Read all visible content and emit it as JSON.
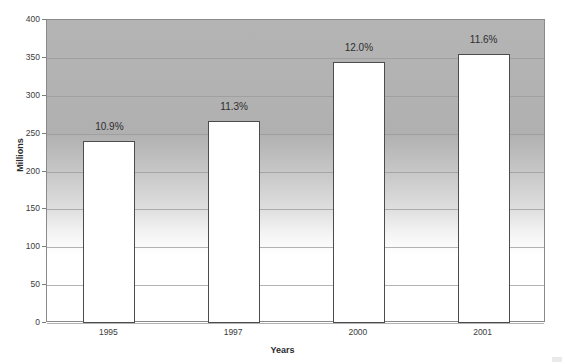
{
  "chart_data": {
    "type": "bar",
    "title": "",
    "xlabel": "Years",
    "ylabel": "Millions",
    "categories": [
      "1995",
      "1997",
      "2000",
      "2001"
    ],
    "values": [
      240,
      267,
      344,
      355
    ],
    "data_labels": [
      "10.9%",
      "11.3%",
      "12.0%",
      "11.6%"
    ],
    "ylim": [
      0,
      400
    ],
    "ytick_labels": [
      "400",
      "350",
      "300",
      "250",
      "200",
      "150",
      "100",
      "50",
      "0"
    ],
    "ytick_values": [
      400,
      350,
      300,
      250,
      200,
      150,
      100,
      50,
      0
    ],
    "grid": true,
    "legend": false,
    "legend_position": "none",
    "bar_fill_color": "#ffffff",
    "bar_border_color": "#4c4c4c",
    "plot_background": "vertical-gradient-gray-to-white",
    "plot_background_top_color": "#b4b4b4",
    "plot_background_bottom_color": "#ffffff",
    "axis_color": "#8a8a8a",
    "gridline_color": "#9a9a9a",
    "text_color": "#3c3c3c"
  }
}
